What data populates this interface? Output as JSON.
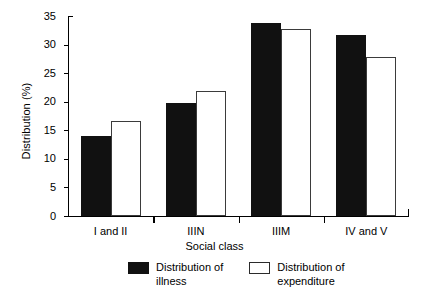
{
  "chart_data": {
    "type": "bar",
    "title": "",
    "xlabel": "Social class",
    "ylabel": "Distribution (%)",
    "categories": [
      "I and II",
      "IIIN",
      "IIIM",
      "IV and V"
    ],
    "series": [
      {
        "name": "Distribution of illness",
        "color": "#111111",
        "values": [
          14.0,
          19.8,
          33.8,
          31.7
        ]
      },
      {
        "name": "Distribution of expenditure",
        "color": "#ffffff",
        "values": [
          16.7,
          21.8,
          32.8,
          27.8
        ]
      }
    ],
    "ylim": [
      0,
      35
    ],
    "yticks": [
      0,
      5,
      10,
      15,
      20,
      25,
      30,
      35
    ],
    "ytick_labels": [
      "0",
      "5",
      "10",
      "15",
      "20",
      "25",
      "30",
      "35"
    ],
    "grid": false,
    "legend_position": "bottom"
  },
  "legend": {
    "entries": [
      {
        "label": "Distribution of\nillness",
        "swatch": "filled-black-square"
      },
      {
        "label": "Distribution of\nexpenditure",
        "swatch": "open-white-square"
      }
    ]
  },
  "axes": {
    "y_title": "Distribution (%)",
    "x_title": "Social class"
  }
}
